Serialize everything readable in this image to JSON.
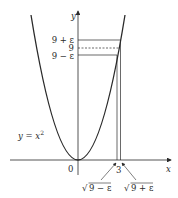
{
  "figure": {
    "curve_label_prefix": "y = x",
    "curve_label_exp": "2",
    "axes": {
      "x_label": "x",
      "y_label": "y",
      "origin_label": "0",
      "x_tick_label": "3"
    },
    "y_levels": {
      "upper": "9 + ε",
      "middle": "9",
      "lower": "9 − ε"
    },
    "x_markers": {
      "left_label": "9 − ε",
      "right_label": "9 + ε",
      "radical": "√"
    },
    "colors": {
      "stroke": "#2a2a2a",
      "background": "#ffffff"
    }
  }
}
